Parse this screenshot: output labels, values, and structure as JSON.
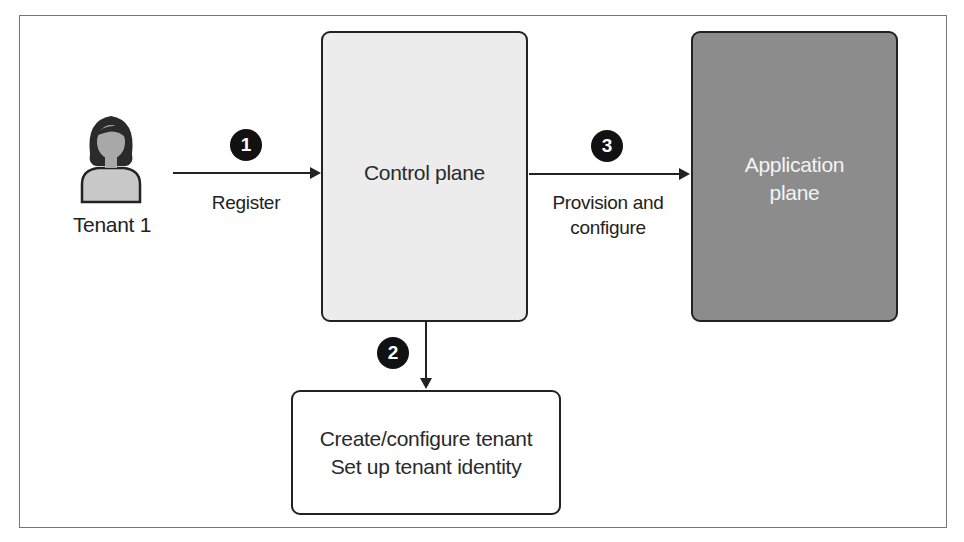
{
  "diagram": {
    "actor": {
      "label": "Tenant 1",
      "icon": "person-icon"
    },
    "nodes": [
      {
        "id": "control_plane",
        "label": "Control plane",
        "fill": "#ececec"
      },
      {
        "id": "application_plane",
        "label_line1": "Application",
        "label_line2": "plane",
        "fill": "#8c8c8c"
      },
      {
        "id": "tenant_setup",
        "label_line1": "Create/configure tenant",
        "label_line2": "Set up tenant identity",
        "fill": "#ffffff"
      }
    ],
    "edges": [
      {
        "step": "1",
        "from": "Tenant 1",
        "to": "control_plane",
        "label": "Register"
      },
      {
        "step": "2",
        "from": "control_plane",
        "to": "tenant_setup",
        "label": ""
      },
      {
        "step": "3",
        "from": "control_plane",
        "to": "application_plane",
        "label_line1": "Provision and",
        "label_line2": "configure"
      }
    ],
    "colors": {
      "badge": "#111111",
      "stroke": "#222222",
      "frame": "#777777"
    }
  }
}
